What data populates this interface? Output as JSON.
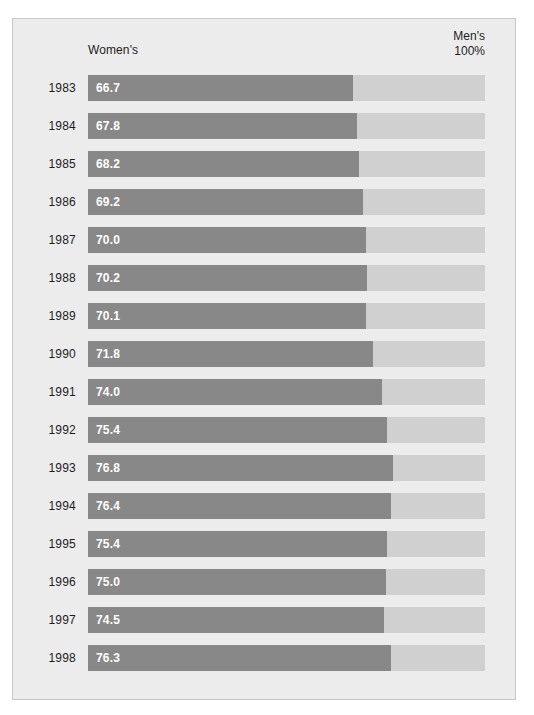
{
  "figure": {
    "background_color": "#ececec",
    "border_color": "#c8c8c8"
  },
  "header": {
    "left_label": "Women's",
    "right_label_line1": "Men's",
    "right_label_line2": "100%"
  },
  "colors": {
    "bar_fill": "#888888",
    "bar_track": "#d0d0d0",
    "value_text": "#ffffff",
    "axis_text": "#1c1c1c"
  },
  "chart_data": {
    "type": "bar",
    "title": "",
    "subtitle": "",
    "xlabel": "",
    "ylabel": "",
    "orientation": "horizontal",
    "stacked": true,
    "grid": false,
    "legend_position": "top",
    "xlim": [
      0,
      100
    ],
    "axis_note_left": "Women's",
    "axis_note_right": "Men's 100%",
    "categories": [
      "1983",
      "1984",
      "1985",
      "1986",
      "1987",
      "1988",
      "1989",
      "1990",
      "1991",
      "1992",
      "1993",
      "1994",
      "1995",
      "1996",
      "1997",
      "1998"
    ],
    "values": [
      66.7,
      67.8,
      68.2,
      69.2,
      70.0,
      70.2,
      70.1,
      71.8,
      74.0,
      75.4,
      76.8,
      76.4,
      75.4,
      75.0,
      74.5,
      76.3
    ],
    "value_labels": [
      "66.7",
      "67.8",
      "68.2",
      "69.2",
      "70.0",
      "70.2",
      "70.1",
      "71.8",
      "74.0",
      "75.4",
      "76.8",
      "76.4",
      "75.4",
      "75.0",
      "74.5",
      "76.3"
    ],
    "series": [
      {
        "name": "Women's",
        "values": [
          66.7,
          67.8,
          68.2,
          69.2,
          70.0,
          70.2,
          70.1,
          71.8,
          74.0,
          75.4,
          76.8,
          76.4,
          75.4,
          75.0,
          74.5,
          76.3
        ]
      },
      {
        "name": "Men's 100%",
        "values": [
          100,
          100,
          100,
          100,
          100,
          100,
          100,
          100,
          100,
          100,
          100,
          100,
          100,
          100,
          100,
          100
        ]
      }
    ]
  },
  "rows": [
    {
      "year": "1983",
      "value": "66.7",
      "pct": 66.7
    },
    {
      "year": "1984",
      "value": "67.8",
      "pct": 67.8
    },
    {
      "year": "1985",
      "value": "68.2",
      "pct": 68.2
    },
    {
      "year": "1986",
      "value": "69.2",
      "pct": 69.2
    },
    {
      "year": "1987",
      "value": "70.0",
      "pct": 70.0
    },
    {
      "year": "1988",
      "value": "70.2",
      "pct": 70.2
    },
    {
      "year": "1989",
      "value": "70.1",
      "pct": 70.1
    },
    {
      "year": "1990",
      "value": "71.8",
      "pct": 71.8
    },
    {
      "year": "1991",
      "value": "74.0",
      "pct": 74.0
    },
    {
      "year": "1992",
      "value": "75.4",
      "pct": 75.4
    },
    {
      "year": "1993",
      "value": "76.8",
      "pct": 76.8
    },
    {
      "year": "1994",
      "value": "76.4",
      "pct": 76.4
    },
    {
      "year": "1995",
      "value": "75.4",
      "pct": 75.4
    },
    {
      "year": "1996",
      "value": "75.0",
      "pct": 75.0
    },
    {
      "year": "1997",
      "value": "74.5",
      "pct": 74.5
    },
    {
      "year": "1998",
      "value": "76.3",
      "pct": 76.3
    }
  ]
}
